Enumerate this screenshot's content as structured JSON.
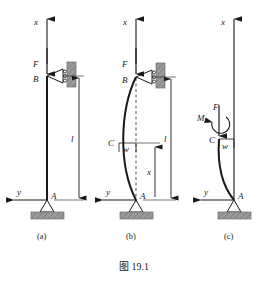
{
  "figure": {
    "caption": "图 19.1",
    "colors": {
      "line": "#1a1a1a",
      "support_fill": "#9a9a9a",
      "wall_fill": "#9a9a9a",
      "background": "#ffffff",
      "dashed": "#555555"
    }
  },
  "panels": [
    {
      "id": "a",
      "label": "(a)",
      "description": "Straight pin-ended column under axial load",
      "labels": {
        "axis_x": "x",
        "axis_y": "y",
        "force": "F",
        "node_top": "B",
        "node_bottom": "A",
        "length": "l"
      }
    },
    {
      "id": "b",
      "label": "(b)",
      "description": "Buckled column with lateral deflection",
      "labels": {
        "axis_x": "x",
        "axis_y": "y",
        "force": "F",
        "node_top": "B",
        "node_mid": "C",
        "node_bottom": "A",
        "deflection": "w",
        "length": "l",
        "coordinate": "x"
      }
    },
    {
      "id": "c",
      "label": "(c)",
      "description": "Free body diagram of lower segment with internal moment",
      "labels": {
        "axis_x": "x",
        "axis_y": "y",
        "force": "F",
        "moment": "M",
        "node_cut": "C",
        "node_bottom": "A",
        "deflection": "w"
      }
    }
  ]
}
